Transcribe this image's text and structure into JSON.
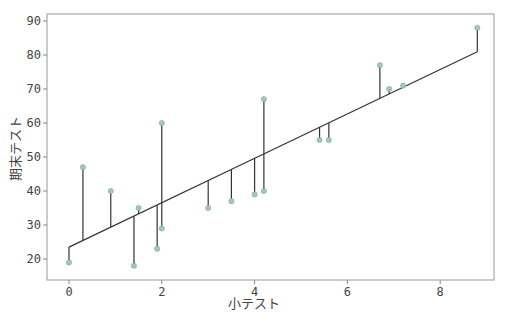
{
  "chart_data": {
    "type": "scatter",
    "title": "",
    "xlabel": "小テスト",
    "ylabel": "期末テスト",
    "xlim": [
      -0.45,
      9.2
    ],
    "ylim": [
      14,
      92
    ],
    "xticks": [
      0,
      2,
      4,
      6,
      8
    ],
    "yticks": [
      20,
      30,
      40,
      50,
      60,
      70,
      80,
      90
    ],
    "grid": false,
    "legend": null,
    "points": [
      {
        "x": 0.0,
        "y": 19
      },
      {
        "x": 0.3,
        "y": 47
      },
      {
        "x": 0.9,
        "y": 40
      },
      {
        "x": 1.4,
        "y": 18
      },
      {
        "x": 1.5,
        "y": 35
      },
      {
        "x": 1.9,
        "y": 23
      },
      {
        "x": 2.0,
        "y": 60
      },
      {
        "x": 2.0,
        "y": 29
      },
      {
        "x": 3.0,
        "y": 35
      },
      {
        "x": 3.5,
        "y": 37
      },
      {
        "x": 4.0,
        "y": 39
      },
      {
        "x": 4.2,
        "y": 67
      },
      {
        "x": 4.2,
        "y": 40
      },
      {
        "x": 5.4,
        "y": 55
      },
      {
        "x": 5.6,
        "y": 55
      },
      {
        "x": 6.7,
        "y": 77
      },
      {
        "x": 6.9,
        "y": 70
      },
      {
        "x": 7.2,
        "y": 71
      },
      {
        "x": 8.8,
        "y": 88
      }
    ],
    "regression_line": {
      "intercept": 23.5,
      "slope": 6.53,
      "x_range": [
        0.0,
        8.8
      ]
    },
    "residual_lines": true,
    "colors": {
      "points": "#9fc9c0",
      "point_edge": "#7fa8a0",
      "line": "#333333",
      "residual": "#333333",
      "axes": "#888888",
      "text": "#444444"
    }
  }
}
